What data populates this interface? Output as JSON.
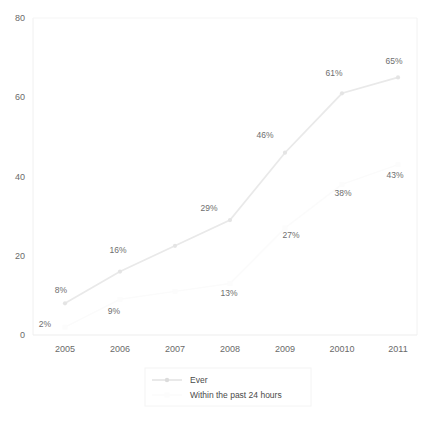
{
  "chart_data": {
    "type": "line",
    "title": "",
    "subtitle": "",
    "xlabel": "",
    "ylabel": "",
    "categories": [
      "2005",
      "2006",
      "2007",
      "2008",
      "2009",
      "20010",
      "2011"
    ],
    "ylim": [
      0,
      80
    ],
    "xlim_categories": 7,
    "yticks": [
      "0",
      "20",
      "40",
      "60",
      "80"
    ],
    "ytick_values": [
      0,
      20,
      40,
      60,
      80
    ],
    "grid": false,
    "legend_position": "bottom-center",
    "series": [
      {
        "name": "Ever",
        "color": "#e9e9e9",
        "marker": "diamond",
        "x": [
          "2005",
          "2006",
          "2007",
          "2008",
          "2009",
          "20010",
          "2011"
        ],
        "values": [
          8,
          16,
          22.5,
          29,
          46,
          61,
          65
        ],
        "labels": [
          "8%",
          "16%",
          "",
          "29%",
          "46%",
          "61%",
          "65%"
        ]
      },
      {
        "name": "Within the past 24 hours",
        "color": "#fbfbfb",
        "marker": "square",
        "x": [
          "2005",
          "2006",
          "2007",
          "2008",
          "2009",
          "20010",
          "2011"
        ],
        "values": [
          2,
          9,
          11,
          13,
          27,
          38,
          43
        ],
        "labels": [
          "2%",
          "9%",
          "",
          "13%",
          "27%",
          "38%",
          "43%"
        ]
      }
    ],
    "annotations": [
      {
        "text": "8%",
        "x": 61,
        "y": 293
      },
      {
        "text": "16%",
        "x": 110,
        "y": 253
      },
      {
        "text": "29%",
        "x": 203,
        "y": 211
      },
      {
        "text": "46%",
        "x": 255,
        "y": 138
      },
      {
        "text": "61%",
        "x": 323,
        "y": 76
      },
      {
        "text": "65%",
        "x": 385,
        "y": 64
      },
      {
        "text": "2%",
        "x": 40,
        "y": 327
      },
      {
        "text": "9%",
        "x": 109,
        "y": 314
      },
      {
        "text": "13%",
        "x": 219,
        "y": 296
      },
      {
        "text": "27%",
        "x": 281,
        "y": 238
      },
      {
        "text": "38%",
        "x": 332,
        "y": 196
      },
      {
        "text": "43%",
        "x": 385,
        "y": 178
      }
    ]
  },
  "legend": {
    "entries": [
      {
        "label": "Ever",
        "color": "#e2e2e2"
      },
      {
        "label": "Within the past 24 hours",
        "color": "#fafafa"
      }
    ]
  },
  "axes": {
    "y_tick_labels": [
      "80",
      "60",
      "40",
      "20",
      "0"
    ],
    "x_tick_labels": [
      "2005",
      "2006",
      "2007",
      "2008",
      "2009",
      "20010",
      "2011"
    ]
  }
}
